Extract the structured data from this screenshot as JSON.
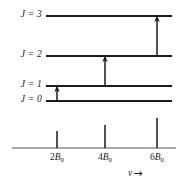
{
  "figure": {
    "type": "energy-level-and-spectrum-diagram",
    "title": "",
    "background_color": "#ffffff",
    "line_color": "#1a1a1a"
  },
  "energy_levels": [
    {
      "label_J": "J",
      "label_eq": "=",
      "label_value": "3",
      "label_text": "J = 3",
      "y": 16,
      "x_start": 46,
      "x_end": 172
    },
    {
      "label_J": "J",
      "label_eq": "=",
      "label_value": "2",
      "label_text": "J = 2",
      "y": 56,
      "x_start": 46,
      "x_end": 172
    },
    {
      "label_J": "J",
      "label_eq": "=",
      "label_value": "1",
      "label_text": "J = 1",
      "y": 86,
      "x_start": 46,
      "x_end": 172
    },
    {
      "label_J": "J",
      "label_eq": "=",
      "label_value": "0",
      "label_text": "J = 0",
      "y": 101,
      "x_start": 46,
      "x_end": 172
    }
  ],
  "transitions": [
    {
      "name": "transition-0-to-1",
      "from_level": "J = 0",
      "to_level": "J = 1",
      "x": 57,
      "y_start": 101,
      "y_end": 86
    },
    {
      "name": "transition-1-to-2",
      "from_level": "J = 1",
      "to_level": "J = 2",
      "x": 105,
      "y_start": 86,
      "y_end": 56
    },
    {
      "name": "transition-2-to-3",
      "from_level": "J = 2",
      "to_level": "J = 3",
      "x": 157,
      "y_start": 56,
      "y_end": 16
    }
  ],
  "spectrum": {
    "baseline": {
      "y": 148,
      "x_start": 12,
      "x_end": 176
    },
    "axis_label": {
      "symbol": "ν",
      "arrow": "→"
    },
    "lines": [
      {
        "label_prefix": "2",
        "label_symbol": "B",
        "label_sub": "0",
        "label_text": "2B₀",
        "x": 57,
        "height": 17,
        "top_y": 131
      },
      {
        "label_prefix": "4",
        "label_symbol": "B",
        "label_sub": "0",
        "label_text": "4B₀",
        "x": 105,
        "height": 23,
        "top_y": 125
      },
      {
        "label_prefix": "6",
        "label_symbol": "B",
        "label_sub": "0",
        "label_text": "6B₀",
        "x": 157,
        "height": 30,
        "top_y": 118
      }
    ]
  }
}
